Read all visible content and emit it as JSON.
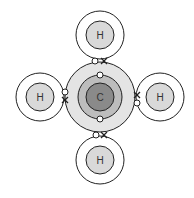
{
  "diagram": {
    "colors": {
      "background": "#ffffff",
      "line": "#222222",
      "carbon_core": "#8a8a8a",
      "carbon_inner_shell": "#bdbdbd",
      "carbon_outer_shell": "#e4e4e4",
      "hydrogen_core": "#d9d9d9",
      "electron_fill": "#ffffff"
    },
    "carbon": {
      "label": "C",
      "cx": 100,
      "cy": 97
    },
    "hydrogens": [
      {
        "label": "H",
        "position": "top",
        "cx": 100,
        "cy": 35
      },
      {
        "label": "H",
        "position": "left",
        "cx": 40,
        "cy": 97
      },
      {
        "label": "H",
        "position": "right",
        "cx": 160,
        "cy": 97
      },
      {
        "label": "H",
        "position": "bottom",
        "cx": 100,
        "cy": 160
      }
    ],
    "legend": {
      "circle_electron": "carbon electron (o)",
      "cross_electron": "hydrogen electron (x)"
    }
  }
}
